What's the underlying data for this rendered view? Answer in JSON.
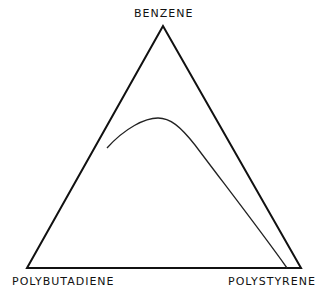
{
  "diagram": {
    "type": "ternary",
    "vertices": {
      "top": "BENZENE",
      "bottom_left": "POLYBUTADIENE",
      "bottom_right": "POLYSTYRENE"
    },
    "curve": "phase boundary (binodal) curve"
  }
}
